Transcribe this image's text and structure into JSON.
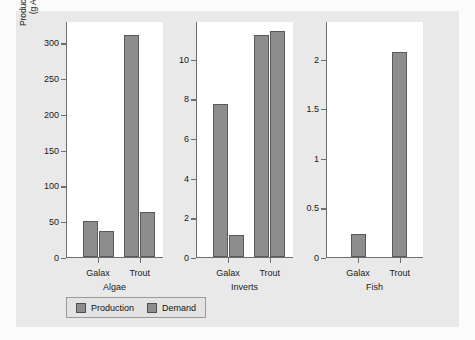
{
  "chart_data": {
    "type": "bar",
    "title": "",
    "xlabel": "",
    "ylabel": "Production/demand (g AFD⁻¹ m⁻²)",
    "ylabel_line1": "Production/demand",
    "ylabel_line2_prefix": "(g AFD",
    "ylabel_line2_sup1": "-1",
    "ylabel_line2_mid": " m",
    "ylabel_line2_sup2": "-2",
    "ylabel_line2_suffix": ")",
    "grid": false,
    "legend_position": "bottom-left",
    "categories": [
      "Galax",
      "Trout"
    ],
    "series": [
      {
        "name": "Production",
        "color": "#8d8d8d"
      },
      {
        "name": "Demand",
        "color": "#8d8d8d"
      }
    ],
    "panels": [
      {
        "name": "Algae",
        "ylim": [
          0,
          330
        ],
        "yticks": [
          0,
          50,
          100,
          150,
          200,
          250,
          300
        ],
        "ytick_labels": [
          "0",
          "50",
          "100",
          "150",
          "200",
          "250",
          "300"
        ],
        "groups": [
          {
            "category": "Galax",
            "production": 50,
            "demand": 36
          },
          {
            "category": "Trout",
            "production": 310,
            "demand": 63
          }
        ]
      },
      {
        "name": "Inverts",
        "ylim": [
          0,
          11.9
        ],
        "yticks": [
          0,
          2,
          4,
          6,
          8,
          10
        ],
        "ytick_labels": [
          "0",
          "2",
          "4",
          "6",
          "8",
          "10"
        ],
        "groups": [
          {
            "category": "Galax",
            "production": 7.7,
            "demand": 1.1
          },
          {
            "category": "Trout",
            "production": 11.2,
            "demand": 11.4
          }
        ]
      },
      {
        "name": "Fish",
        "ylim": [
          0,
          2.38
        ],
        "yticks": [
          0,
          0.5,
          1,
          1.5,
          2
        ],
        "ytick_labels": [
          "0",
          "0.5",
          "1",
          "1.5",
          "2"
        ],
        "groups": [
          {
            "category": "Galax",
            "production": 0.23,
            "demand": null
          },
          {
            "category": "Trout",
            "production": 2.07,
            "demand": null
          }
        ]
      }
    ]
  },
  "legend": {
    "items": [
      {
        "label": "Production"
      },
      {
        "label": "Demand"
      }
    ]
  }
}
